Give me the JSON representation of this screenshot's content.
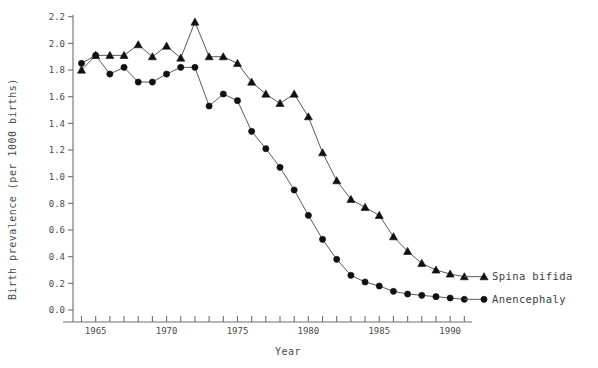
{
  "chart_data": {
    "type": "line",
    "title": "",
    "xlabel": "Year",
    "ylabel": "Birth prevalence (per 1000 births)",
    "xlim": [
      1963.4,
      1991.4
    ],
    "ylim": [
      0.0,
      2.2
    ],
    "grid": false,
    "legend_position": "right-inline",
    "x_major_labels": [
      "1965",
      "1970",
      "1975",
      "1980",
      "1985",
      "1990"
    ],
    "x_major_values": [
      1965,
      1970,
      1975,
      1980,
      1985,
      1990
    ],
    "x_minor_step": 1,
    "y_ticks": [
      "0.0",
      "0.2",
      "0.4",
      "0.6",
      "0.8",
      "1.0",
      "1.2",
      "1.4",
      "1.6",
      "1.8",
      "2.0",
      "2.2"
    ],
    "y_tick_values": [
      0.0,
      0.2,
      0.4,
      0.6,
      0.8,
      1.0,
      1.2,
      1.4,
      1.6,
      1.8,
      2.0,
      2.2
    ],
    "x": [
      1964,
      1965,
      1966,
      1967,
      1968,
      1969,
      1970,
      1971,
      1972,
      1973,
      1974,
      1975,
      1976,
      1977,
      1978,
      1979,
      1980,
      1981,
      1982,
      1983,
      1984,
      1985,
      1986,
      1987,
      1988,
      1989,
      1990,
      1991
    ],
    "series": [
      {
        "name": "Spina bifida",
        "marker": "triangle",
        "color": "#111111",
        "values": [
          1.8,
          1.91,
          1.91,
          1.91,
          1.99,
          1.9,
          1.98,
          1.89,
          2.16,
          1.9,
          1.9,
          1.85,
          1.71,
          1.62,
          1.55,
          1.62,
          1.45,
          1.18,
          0.97,
          0.83,
          0.77,
          0.71,
          0.55,
          0.44,
          0.35,
          0.3,
          0.27,
          0.25
        ]
      },
      {
        "name": "Anencephaly",
        "marker": "circle",
        "color": "#111111",
        "values": [
          1.85,
          1.91,
          1.77,
          1.82,
          1.71,
          1.71,
          1.77,
          1.82,
          1.82,
          1.53,
          1.62,
          1.57,
          1.34,
          1.21,
          1.07,
          0.9,
          0.71,
          0.53,
          0.38,
          0.26,
          0.21,
          0.18,
          0.14,
          0.12,
          0.11,
          0.1,
          0.09,
          0.08
        ]
      }
    ],
    "annotations": [
      {
        "text": "Spina bifida",
        "series": 0
      },
      {
        "text": "Anencephaly",
        "series": 1
      }
    ]
  },
  "figure": {
    "caption_fragment": ""
  }
}
